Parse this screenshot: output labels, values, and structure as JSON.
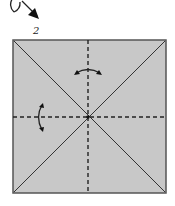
{
  "diagram": {
    "type": "origami-fold-step",
    "step_number": "2",
    "colors": {
      "paper_fill": "#c8c8c8",
      "paper_border": "#555555",
      "line": "#222222",
      "background": "#ffffff"
    },
    "square": {
      "x": 13,
      "y": 40,
      "size": 153
    },
    "creases": [
      {
        "kind": "diagonal",
        "style": "solid"
      },
      {
        "kind": "diagonal",
        "style": "solid"
      },
      {
        "kind": "vertical-center",
        "style": "dashed",
        "meaning": "valley fold"
      },
      {
        "kind": "horizontal-center",
        "style": "dashed",
        "meaning": "valley fold"
      }
    ],
    "arrows": [
      {
        "name": "curved-arrow-horizontal",
        "position": "upper-center",
        "meaning": "fold back and forth (crease)"
      },
      {
        "name": "curved-arrow-vertical",
        "position": "left-middle",
        "meaning": "fold back and forth (crease)"
      },
      {
        "name": "step-pointer-arrow",
        "position": "top-left",
        "meaning": "continuation from previous step"
      }
    ]
  }
}
